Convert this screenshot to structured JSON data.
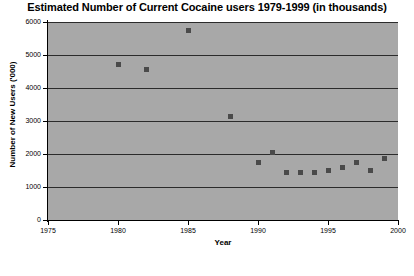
{
  "chart_data": {
    "type": "scatter",
    "title": "Estimated Number of Current Cocaine users 1979-1999 (in thousands)",
    "xlabel": "Year",
    "ylabel": "Number of New Users ('000)",
    "xlim": [
      1975,
      2000
    ],
    "ylim": [
      0,
      6000
    ],
    "xticks": [
      1975,
      1980,
      1985,
      1990,
      1995,
      2000
    ],
    "xtick_labels": [
      "1975",
      "1980",
      "1985",
      "1990",
      "1995",
      "2000"
    ],
    "yticks": [
      0,
      1000,
      2000,
      3000,
      4000,
      5000,
      6000
    ],
    "ytick_labels": [
      "0",
      "1000",
      "2000",
      "3000",
      "4000",
      "5000",
      "6000"
    ],
    "grid": true,
    "grid_orientation": "horizontal",
    "legend": false,
    "plot_background": "#a8a8a8",
    "marker_color": "#4a4a4a",
    "marker_shape": "square",
    "series": [
      {
        "name": "Current cocaine users",
        "points": [
          {
            "x": 1980,
            "y": 4700
          },
          {
            "x": 1982,
            "y": 4550
          },
          {
            "x": 1985,
            "y": 5750
          },
          {
            "x": 1988,
            "y": 3150
          },
          {
            "x": 1990,
            "y": 1750
          },
          {
            "x": 1991,
            "y": 2050
          },
          {
            "x": 1992,
            "y": 1450
          },
          {
            "x": 1993,
            "y": 1450
          },
          {
            "x": 1994,
            "y": 1450
          },
          {
            "x": 1995,
            "y": 1500
          },
          {
            "x": 1996,
            "y": 1600
          },
          {
            "x": 1997,
            "y": 1750
          },
          {
            "x": 1998,
            "y": 1500
          },
          {
            "x": 1999,
            "y": 1850
          }
        ]
      }
    ]
  }
}
